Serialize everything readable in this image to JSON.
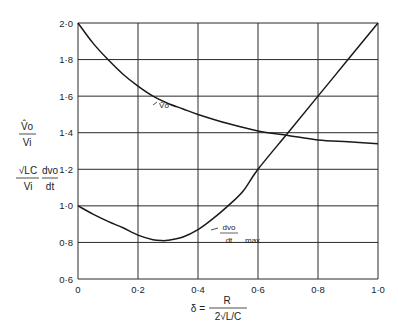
{
  "chart_data": {
    "type": "line",
    "title": "",
    "xlabel": "δ = R / (2√(L/C))",
    "ylabel_top": "V̂o / Vi",
    "ylabel_bottom": "(√LC / Vi) · (dvo/dt)",
    "xlim": [
      0,
      1.0
    ],
    "ylim": [
      0.6,
      2.0
    ],
    "grid": true,
    "x_ticks": [
      "0",
      "0·2",
      "0·4",
      "0·6",
      "0·8",
      "1·0"
    ],
    "x_tick_values": [
      0,
      0.2,
      0.4,
      0.6,
      0.8,
      1.0
    ],
    "y_ticks": [
      "0·6",
      "0·8",
      "1·0",
      "1·2",
      "1·4",
      "1·6",
      "1·8",
      "2·0"
    ],
    "y_tick_values": [
      0.6,
      0.8,
      1.0,
      1.2,
      1.4,
      1.6,
      1.8,
      2.0
    ],
    "series": [
      {
        "name": "V̂o",
        "annotation": "V̂o",
        "x": [
          0,
          0.05,
          0.1,
          0.15,
          0.2,
          0.25,
          0.3,
          0.35,
          0.4,
          0.5,
          0.6,
          0.7,
          0.8,
          0.9,
          1.0
        ],
        "y": [
          2.0,
          1.89,
          1.8,
          1.72,
          1.655,
          1.6,
          1.56,
          1.53,
          1.5,
          1.45,
          1.41,
          1.385,
          1.36,
          1.35,
          1.34
        ]
      },
      {
        "name": "dvo/dt max.",
        "annotation": "dvo/dt max.",
        "x": [
          0,
          0.05,
          0.1,
          0.15,
          0.2,
          0.25,
          0.28,
          0.3,
          0.35,
          0.4,
          0.45,
          0.5,
          0.55,
          0.6,
          0.7,
          0.8,
          0.9,
          1.0
        ],
        "y": [
          1.0,
          0.955,
          0.915,
          0.88,
          0.84,
          0.815,
          0.81,
          0.812,
          0.83,
          0.87,
          0.93,
          1.0,
          1.08,
          1.2,
          1.4,
          1.6,
          1.8,
          2.0
        ]
      }
    ]
  },
  "labels": {
    "y_top_num": "V̂o",
    "y_top_den": "Vi",
    "y_bot_num_a": "√LC",
    "y_bot_den_a": "Vi",
    "y_bot_num_b": "dvo",
    "y_bot_den_b": "dt",
    "x_lhs": "δ =",
    "x_num": "R",
    "x_den": "2√L/C",
    "ann_vo": "V̂o",
    "ann_dv_num": "dvo",
    "ann_dv_den": "dt",
    "ann_dv_max": "max."
  }
}
